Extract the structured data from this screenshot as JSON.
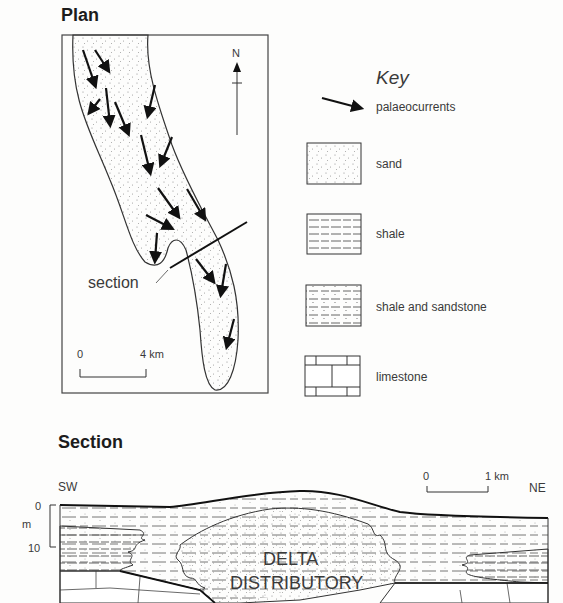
{
  "plan": {
    "title": "Plan",
    "north_label": "N",
    "section_label": "section",
    "scale": {
      "start": "0",
      "end": "4 km"
    }
  },
  "key": {
    "title": "Key",
    "items": [
      {
        "symbol": "arrow",
        "label": "palaeocurrents"
      },
      {
        "symbol": "sand",
        "label": "sand"
      },
      {
        "symbol": "shale",
        "label": "shale"
      },
      {
        "symbol": "shale-sandstone",
        "label": "shale and sandstone"
      },
      {
        "symbol": "limestone",
        "label": "limestone"
      }
    ]
  },
  "section": {
    "title": "Section",
    "left_direction": "SW",
    "right_direction": "NE",
    "vertical_scale": {
      "top": "0",
      "unit": "m",
      "bottom": "10"
    },
    "horizontal_scale": {
      "start": "0",
      "end": "1 km"
    },
    "body_label_line1": "DELTA",
    "body_label_line2": "DISTRIBUTORY"
  }
}
